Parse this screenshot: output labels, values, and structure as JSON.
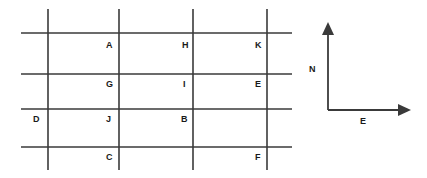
{
  "figure": {
    "type": "street-grid-diagram",
    "background_color": "#ffffff",
    "line_color": "#3a3a3a",
    "text_color": "#1a1a1a",
    "width": 427,
    "height": 178
  },
  "grid": {
    "vertical_streets": [
      {
        "id": "v1",
        "x": 48,
        "y1": 9,
        "y2": 170
      },
      {
        "id": "v2",
        "x": 119,
        "y1": 9,
        "y2": 170
      },
      {
        "id": "v3",
        "x": 193,
        "y1": 9,
        "y2": 170
      },
      {
        "id": "v4",
        "x": 267,
        "y1": 9,
        "y2": 170
      }
    ],
    "horizontal_streets": [
      {
        "id": "h1",
        "y": 33,
        "x1": 21,
        "x2": 292
      },
      {
        "id": "h2",
        "y": 74,
        "x1": 21,
        "x2": 292
      },
      {
        "id": "h3",
        "y": 109,
        "x1": 21,
        "x2": 292
      },
      {
        "id": "h4",
        "y": 147,
        "x1": 21,
        "x2": 292
      }
    ],
    "line_width": 1.6
  },
  "nodes": [
    {
      "label": "A",
      "x": 106,
      "y": 40
    },
    {
      "label": "H",
      "x": 182,
      "y": 40
    },
    {
      "label": "K",
      "x": 255,
      "y": 40
    },
    {
      "label": "G",
      "x": 106,
      "y": 79
    },
    {
      "label": "I",
      "x": 183,
      "y": 79
    },
    {
      "label": "E",
      "x": 255,
      "y": 79
    },
    {
      "label": "D",
      "x": 33,
      "y": 114
    },
    {
      "label": "J",
      "x": 106,
      "y": 114
    },
    {
      "label": "B",
      "x": 181,
      "y": 114
    },
    {
      "label": "C",
      "x": 106,
      "y": 152
    },
    {
      "label": "F",
      "x": 255,
      "y": 152
    }
  ],
  "compass": {
    "corner": {
      "x": 328,
      "y": 110
    },
    "north": {
      "label": "N",
      "label_x": 309,
      "label_y": 64,
      "shaft_top": 34,
      "tip_y": 22,
      "head_half_width": 6,
      "head_height": 13
    },
    "east": {
      "label": "E",
      "label_x": 360,
      "label_y": 116,
      "shaft_right": 398,
      "tip_x": 411,
      "head_half_height": 6,
      "head_width": 13
    }
  }
}
